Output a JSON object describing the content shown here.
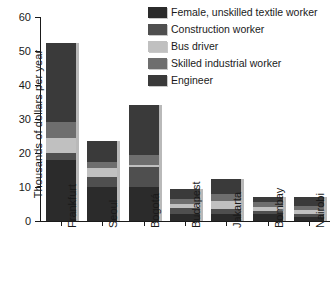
{
  "chart_data": {
    "type": "bar",
    "subtype": "stacked-bar",
    "title": "",
    "xlabel": "",
    "ylabel": "Thousands of dollars per year",
    "ylim": [
      0,
      60
    ],
    "yticks": [
      0,
      10,
      20,
      30,
      40,
      50,
      60
    ],
    "grid": false,
    "legend_position": "top-right",
    "categories": [
      "Frankfurt",
      "Seoul",
      "Bogotá",
      "Budapest",
      "Jakarta",
      "Bombay",
      "Nairobi"
    ],
    "series": [
      {
        "name": "Female, unskilled textile worker",
        "color": "#2b2b2b",
        "values": [
          18.0,
          10.0,
          10.0,
          2.2,
          2.0,
          2.0,
          1.2
        ]
      },
      {
        "name": "Construction worker",
        "color": "#4f4f4f",
        "values": [
          2.0,
          3.0,
          6.0,
          1.6,
          1.5,
          1.0,
          1.0
        ]
      },
      {
        "name": "Bus driver",
        "color": "#c0c0c0",
        "values": [
          4.5,
          2.5,
          0.5,
          1.3,
          2.5,
          1.2,
          0.9
        ]
      },
      {
        "name": "Skilled industrial worker",
        "color": "#6e6e6e",
        "values": [
          4.5,
          2.0,
          3.0,
          1.4,
          2.0,
          1.3,
          1.4
        ]
      },
      {
        "name": "Engineer",
        "color": "#3a3a3a",
        "values": [
          23.5,
          6.0,
          14.5,
          3.0,
          4.5,
          1.5,
          2.5
        ]
      }
    ],
    "totals": [
      52.5,
      23.5,
      34.0,
      9.5,
      12.5,
      7.0,
      7.0
    ]
  },
  "legend": {
    "items": [
      {
        "label": "Female, unskilled textile worker",
        "color": "#2b2b2b"
      },
      {
        "label": "Construction worker",
        "color": "#4f4f4f"
      },
      {
        "label": "Bus driver",
        "color": "#c0c0c0"
      },
      {
        "label": "Skilled industrial worker",
        "color": "#6e6e6e"
      },
      {
        "label": "Engineer",
        "color": "#3a3a3a"
      }
    ]
  },
  "axis": {
    "y_title": "Thousands of dollars per year",
    "y_tick_labels": [
      "0",
      "10",
      "20",
      "30",
      "40",
      "50",
      "60"
    ],
    "x_tick_labels": [
      "Frankfurt",
      "Seoul",
      "Bogotá",
      "Budapest",
      "Jakarta",
      "Bombay",
      "Nairobi"
    ]
  }
}
